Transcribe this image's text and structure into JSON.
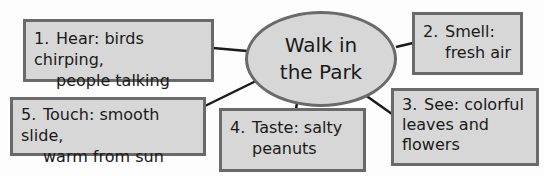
{
  "diagram": {
    "type": "web / concept map",
    "center": {
      "line1": "Walk in",
      "line2": "the Park"
    },
    "nodes": [
      {
        "num": "1.",
        "label": "Hear: birds chirping,",
        "cont": "people talking"
      },
      {
        "num": "2.",
        "label": "Smell:",
        "cont": "fresh air"
      },
      {
        "num": "3.",
        "label": "See: colorful",
        "cont": "leaves and",
        "cont2": "flowers"
      },
      {
        "num": "4.",
        "label": "Taste: salty",
        "cont": "peanuts"
      },
      {
        "num": "5.",
        "label": "Touch: smooth slide,",
        "cont": "warm from sun"
      }
    ],
    "colors": {
      "fill": "#d7d7d7",
      "border": "#6a6a6a",
      "line": "#1a1a1a"
    }
  }
}
